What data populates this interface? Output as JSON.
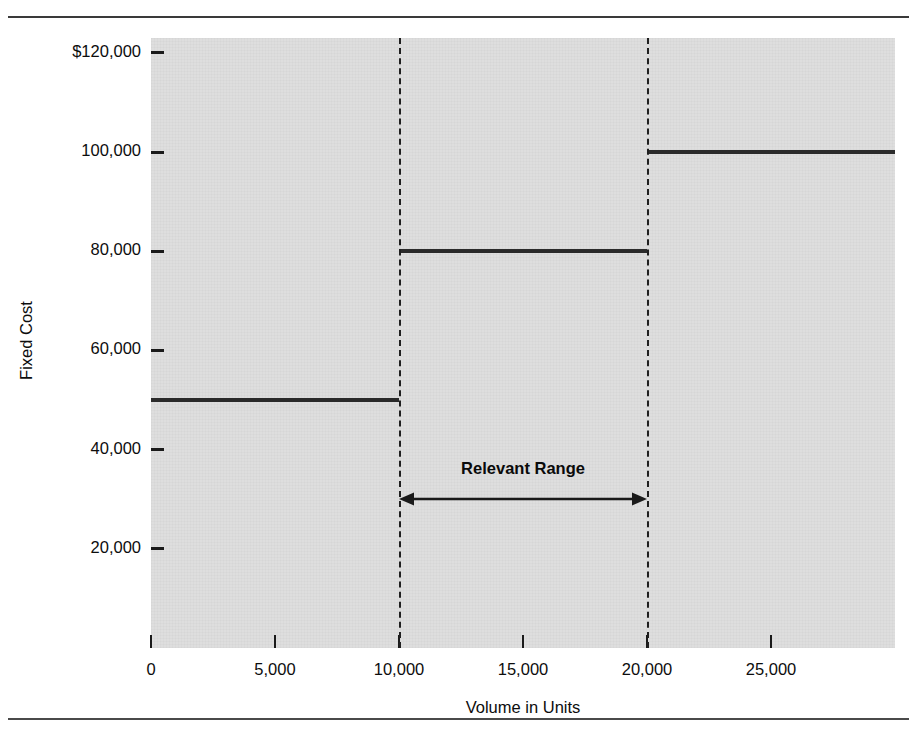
{
  "chart_data": {
    "type": "line",
    "subtype": "step",
    "title": "",
    "xlabel": "Volume in Units",
    "ylabel": "Fixed Cost",
    "xlim": [
      0,
      30000
    ],
    "ylim": [
      0,
      123000
    ],
    "grid": false,
    "legend": null,
    "x_ticks": [
      {
        "value": 0,
        "label": "0"
      },
      {
        "value": 5000,
        "label": "5,000"
      },
      {
        "value": 10000,
        "label": "10,000"
      },
      {
        "value": 15000,
        "label": "15,000"
      },
      {
        "value": 20000,
        "label": "20,000"
      },
      {
        "value": 25000,
        "label": "25,000"
      }
    ],
    "y_ticks": [
      {
        "value": 120000,
        "label": "$120,000"
      },
      {
        "value": 100000,
        "label": "100,000"
      },
      {
        "value": 80000,
        "label": "80,000"
      },
      {
        "value": 60000,
        "label": "60,000"
      },
      {
        "value": 40000,
        "label": "40,000"
      },
      {
        "value": 20000,
        "label": "20,000"
      }
    ],
    "steps": [
      {
        "name": "step-1",
        "x_start": 0,
        "x_end": 10000,
        "y": 50000
      },
      {
        "name": "step-2",
        "x_start": 10000,
        "x_end": 20000,
        "y": 80000
      },
      {
        "name": "step-3",
        "x_start": 20000,
        "x_end": 30000,
        "y": 100000
      }
    ],
    "reference_lines": [
      {
        "name": "relevant-range-lower",
        "x": 10000,
        "style": "dashed"
      },
      {
        "name": "relevant-range-upper",
        "x": 20000,
        "style": "dashed"
      }
    ],
    "annotations": [
      {
        "name": "relevant-range",
        "label": "Relevant Range",
        "x_start": 10000,
        "x_end": 20000,
        "y": 30000,
        "arrow": "double"
      }
    ]
  },
  "colors": {
    "plot_background": "#dedede",
    "plot_border": "#5a5a5a",
    "step_line": "#2b2b2b",
    "dash_line": "#1f1f1f",
    "text": "#0d0d0d",
    "rule": "#3a3a3a"
  }
}
